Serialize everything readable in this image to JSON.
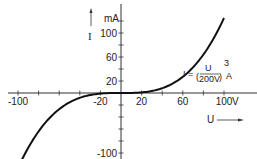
{
  "chart_data": {
    "type": "line",
    "title": "",
    "formula": {
      "lhs": "I",
      "numerator": "U",
      "denominator": "200V",
      "exponent": "3",
      "unit": "A",
      "text": "I = (U / 200V)^3 A"
    },
    "xlabel": "U",
    "xunit": "V",
    "ylabel": "I",
    "yunit": "mA",
    "xlim": [
      -105,
      120
    ],
    "ylim": [
      -105,
      140
    ],
    "x_ticks": [
      -100,
      -80,
      -60,
      -40,
      -20,
      0,
      20,
      40,
      60,
      80,
      100
    ],
    "x_tick_labels": [
      "-100",
      "-20",
      "20",
      "60",
      "100"
    ],
    "x_tick_label_values": [
      -100,
      -20,
      20,
      60,
      100
    ],
    "y_ticks": [
      -100,
      -80,
      -60,
      -40,
      -20,
      0,
      20,
      40,
      60,
      80,
      100,
      120
    ],
    "y_tick_labels": [
      "100",
      "60",
      "20",
      "-100"
    ],
    "y_tick_label_values": [
      100,
      60,
      20,
      -100
    ],
    "grid": false,
    "legend": null,
    "series": [
      {
        "name": "I = (U/200V)^3 A",
        "x": [
          -97,
          -80,
          -60,
          -40,
          -20,
          0,
          20,
          40,
          60,
          80,
          100
        ],
        "y": [
          -114.1,
          -64.0,
          -27.0,
          -8.0,
          -1.0,
          0,
          1.0,
          8.0,
          27.0,
          64.0,
          125.0
        ]
      }
    ]
  },
  "colors": {
    "axis": "#333333",
    "curve": "#111111",
    "text": "#222222",
    "background": "#ffffff"
  }
}
